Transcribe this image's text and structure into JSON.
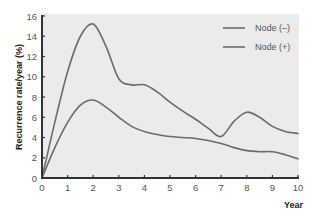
{
  "chart_data": {
    "type": "line",
    "title": "",
    "xlabel": "Year",
    "ylabel": "Recurrence rate/year (%)",
    "xlim": [
      0,
      10
    ],
    "ylim": [
      0,
      16
    ],
    "x_ticks": [
      0,
      1,
      2,
      3,
      4,
      5,
      6,
      7,
      8,
      9,
      10
    ],
    "y_ticks": [
      0,
      2,
      4,
      6,
      8,
      10,
      12,
      14,
      16
    ],
    "grid": false,
    "legend_position": "top-right",
    "series": [
      {
        "name": "Node (–)",
        "x": [
          0,
          0.5,
          1,
          1.5,
          2,
          2.5,
          3,
          3.5,
          4,
          4.5,
          5,
          5.5,
          6,
          6.5,
          7,
          7.5,
          8,
          8.5,
          9,
          9.5,
          10
        ],
        "values": [
          0,
          3.0,
          5.5,
          7.2,
          7.7,
          7.0,
          6.0,
          5.1,
          4.6,
          4.3,
          4.1,
          4.0,
          3.9,
          3.7,
          3.4,
          3.0,
          2.7,
          2.6,
          2.6,
          2.3,
          1.9
        ]
      },
      {
        "name": "Node (+)",
        "x": [
          0,
          0.5,
          1,
          1.5,
          2,
          2.5,
          3,
          3.5,
          4,
          4.5,
          5,
          5.5,
          6,
          6.5,
          7,
          7.5,
          8,
          8.5,
          9,
          9.5,
          10
        ],
        "values": [
          0,
          5.5,
          10.5,
          14.0,
          15.2,
          13.0,
          9.8,
          9.2,
          9.2,
          8.5,
          7.5,
          6.6,
          5.8,
          4.9,
          4.1,
          5.6,
          6.5,
          6.0,
          5.1,
          4.6,
          4.4
        ]
      }
    ]
  },
  "colors": {
    "plot_background": "#ebebeb",
    "line": "#6b6b6b",
    "axis": "#333333"
  }
}
